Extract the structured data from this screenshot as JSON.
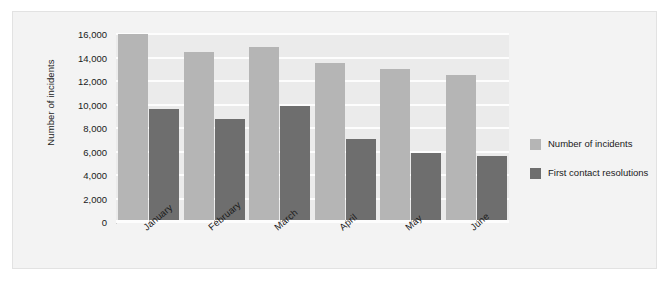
{
  "chart_data": {
    "type": "bar",
    "title": "",
    "xlabel": "",
    "ylabel": "Number of incidents",
    "ylim": [
      0,
      16000
    ],
    "ytick_step": 2000,
    "grid": true,
    "legend_position": "right",
    "categories": [
      "January",
      "February",
      "March",
      "April",
      "May",
      "June"
    ],
    "ytick_labels": [
      "16,000",
      "14,000",
      "12,000",
      "10,000",
      "8,000",
      "6,000",
      "4,000",
      "2,000",
      "0"
    ],
    "ytick_values": [
      16000,
      14000,
      12000,
      10000,
      8000,
      6000,
      4000,
      2000,
      0
    ],
    "series": [
      {
        "name": "Number of incidents",
        "color": "#b5b5b5",
        "values": [
          16000,
          14500,
          14900,
          13500,
          13000,
          12500
        ]
      },
      {
        "name": "First contact resolutions",
        "color": "#6e6e6e",
        "values": [
          9600,
          8800,
          9900,
          7100,
          5900,
          5600
        ]
      }
    ]
  },
  "legend": {
    "items": [
      {
        "label": "Number of incidents",
        "color": "#b5b5b5"
      },
      {
        "label": "First contact resolutions",
        "color": "#6e6e6e"
      }
    ]
  },
  "colors": {
    "panel_background": "#f3f3f3",
    "plot_background": "#ebebeb",
    "gridline": "#fdfdfd",
    "series_primary": "#b5b5b5",
    "series_secondary": "#6e6e6e",
    "text": "#1a1a1a"
  }
}
